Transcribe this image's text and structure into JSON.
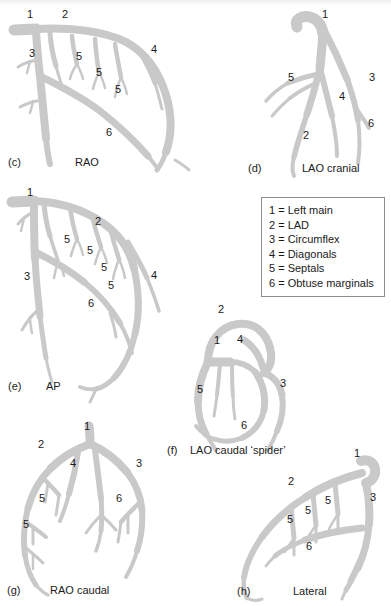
{
  "figure": {
    "vessel_color": "#c9c9c9",
    "background_color": "#ffffff",
    "text_color": "#1a1a1a",
    "legend_border_color": "#8d8d8d"
  },
  "legend": {
    "name": "coronary-segment-key",
    "rows": [
      "1 = Left main",
      "2 = LAD",
      "3 = Circumflex",
      "4 = Diagonals",
      "5 = Septals",
      "6 = Obtuse marginals"
    ]
  },
  "panels": [
    {
      "id": "c",
      "letter": "(c)",
      "name": "RAO",
      "labels": [
        "1",
        "2",
        "3",
        "4",
        "5",
        "5",
        "5",
        "6"
      ]
    },
    {
      "id": "d",
      "letter": "(d)",
      "name": "LAO cranial",
      "labels": [
        "1",
        "2",
        "3",
        "4",
        "5",
        "6"
      ]
    },
    {
      "id": "e",
      "letter": "(e)",
      "name": "AP",
      "labels": [
        "1",
        "2",
        "3",
        "4",
        "5",
        "5",
        "5",
        "5",
        "6"
      ]
    },
    {
      "id": "f",
      "letter": "(f)",
      "name": "LAO caudal ‘spider’",
      "labels": [
        "1",
        "2",
        "3",
        "4",
        "5",
        "6"
      ]
    },
    {
      "id": "g",
      "letter": "(g)",
      "name": "RAO caudal",
      "labels": [
        "1",
        "2",
        "3",
        "4",
        "5",
        "5",
        "6"
      ]
    },
    {
      "id": "h",
      "letter": "(h)",
      "name": "Lateral",
      "labels": [
        "1",
        "2",
        "3",
        "5",
        "5",
        "5",
        "6"
      ]
    }
  ],
  "panel_c": {
    "l1": "1",
    "l2": "2",
    "l3": "3",
    "l4": "4",
    "l5a": "5",
    "l5b": "5",
    "l5c": "5",
    "l6": "6",
    "letter": "(c)",
    "name": "RAO"
  },
  "panel_d": {
    "l1": "1",
    "l2": "2",
    "l3": "3",
    "l4": "4",
    "l5": "5",
    "l6": "6",
    "letter": "(d)",
    "name": "LAO cranial"
  },
  "panel_e": {
    "l1": "1",
    "l2": "2",
    "l3": "3",
    "l4": "4",
    "l5a": "5",
    "l5b": "5",
    "l5c": "5",
    "l5d": "5",
    "l6": "6",
    "letter": "(e)",
    "name": "AP"
  },
  "panel_f": {
    "l1": "1",
    "l2": "2",
    "l3": "3",
    "l4": "4",
    "l5": "5",
    "l6": "6",
    "letter": "(f)",
    "name": "LAO caudal ‘spider’"
  },
  "panel_g": {
    "l1": "1",
    "l2": "2",
    "l3": "3",
    "l4": "4",
    "l5a": "5",
    "l5b": "5",
    "l6": "6",
    "letter": "(g)",
    "name": "RAO caudal"
  },
  "panel_h": {
    "l1": "1",
    "l2": "2",
    "l3": "3",
    "l5a": "5",
    "l5b": "5",
    "l5c": "5",
    "l6": "6",
    "letter": "(h)",
    "name": "Lateral"
  }
}
